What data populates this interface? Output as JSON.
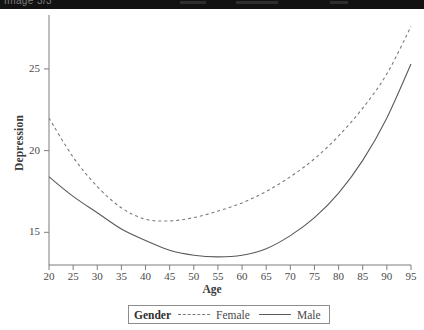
{
  "top_band": {
    "text": "Image 3/3",
    "background": "#121212"
  },
  "chart_data": {
    "type": "line",
    "title": "",
    "xlabel": "Age",
    "ylabel": "Depression",
    "xlim": [
      20,
      95
    ],
    "ylim": [
      13.0,
      28.3
    ],
    "xticks": [
      20,
      25,
      30,
      35,
      40,
      45,
      50,
      55,
      60,
      65,
      70,
      75,
      80,
      85,
      90,
      95
    ],
    "yticks": [
      15,
      20,
      25
    ],
    "grid": false,
    "legend": {
      "position": "bottom",
      "title": "Gender",
      "entries": [
        {
          "name": "Female",
          "style": "dashed",
          "color": "#7a7a7a"
        },
        {
          "name": "Male",
          "style": "solid",
          "color": "#5a5a5a"
        }
      ]
    },
    "x": [
      20,
      25,
      30,
      35,
      40,
      45,
      50,
      55,
      60,
      65,
      70,
      75,
      80,
      85,
      90,
      95
    ],
    "series": [
      {
        "name": "Female",
        "style": "dashed",
        "color": "#7a7a7a",
        "values": [
          22.0,
          19.6,
          17.8,
          16.5,
          15.8,
          15.7,
          15.9,
          16.3,
          16.8,
          17.5,
          18.4,
          19.5,
          20.9,
          22.6,
          24.7,
          27.6
        ]
      },
      {
        "name": "Male",
        "style": "solid",
        "color": "#5a5a5a",
        "values": [
          18.4,
          17.2,
          16.2,
          15.2,
          14.5,
          13.9,
          13.6,
          13.5,
          13.6,
          14.0,
          14.8,
          15.9,
          17.4,
          19.4,
          22.0,
          25.3
        ]
      }
    ]
  }
}
